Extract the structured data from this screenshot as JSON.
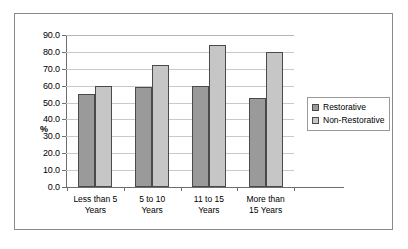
{
  "chart_data": {
    "type": "bar",
    "title": "",
    "xlabel": "",
    "ylabel": "%",
    "ylim": [
      0,
      90
    ],
    "ytick_step": 10,
    "grid": true,
    "legend_position": "right",
    "categories": [
      "Less than 5 Years",
      "5 to 10 Years",
      "11 to 15 Years",
      "More than 15 Years"
    ],
    "category_lines": [
      [
        "Less than 5",
        "Years"
      ],
      [
        "5 to 10",
        "Years"
      ],
      [
        "11 to 15",
        "Years"
      ],
      [
        "More than",
        "15 Years"
      ]
    ],
    "ytick_labels": [
      "90.0",
      "80.0",
      "70.0",
      "60.0",
      "50.0",
      "40.0",
      "30.0",
      "20.0",
      "10.0",
      "0.0"
    ],
    "ytick_values": [
      90,
      80,
      70,
      60,
      50,
      40,
      30,
      20,
      10,
      0
    ],
    "series": [
      {
        "name": "Restorative",
        "color": "#9a9a9a",
        "values": [
          55,
          59,
          60,
          53
        ]
      },
      {
        "name": "Non-Restorative",
        "color": "#c6c6c6",
        "values": [
          60,
          72,
          84,
          80
        ]
      }
    ]
  },
  "legend": {
    "entries": [
      {
        "label": "Restorative"
      },
      {
        "label": "Non-Restorative"
      }
    ]
  }
}
